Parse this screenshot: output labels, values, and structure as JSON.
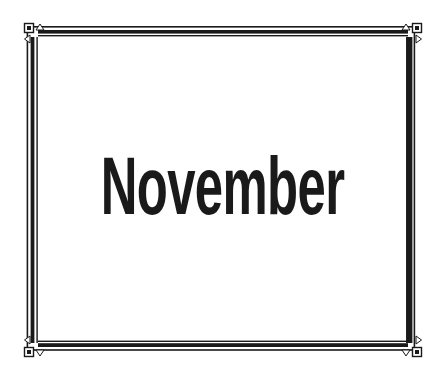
{
  "card": {
    "title": "November"
  },
  "colors": {
    "background": "#ffffff",
    "frame": "#1a1a1a",
    "text": "#1a1a1a"
  },
  "frame": {
    "style": "double-line border with thick inner bar",
    "corner_ornament": "small square with inner dark square and two triangles"
  }
}
